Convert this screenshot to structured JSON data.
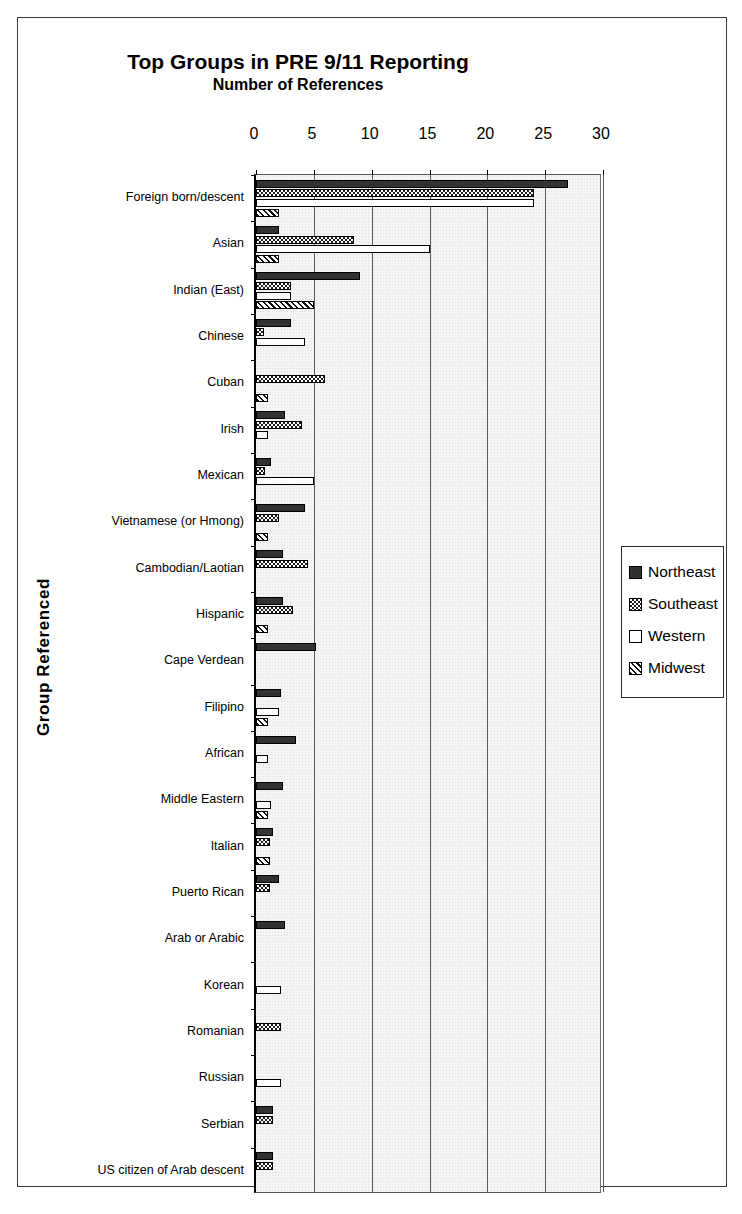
{
  "chart_data": {
    "type": "bar",
    "orientation": "horizontal",
    "title": "Top Groups in PRE 9/11 Reporting",
    "subtitle": "Number of References",
    "xlabel": "Number of References",
    "ylabel": "Group Referenced",
    "xlim": [
      0,
      30
    ],
    "xticks": [
      0,
      5,
      10,
      15,
      20,
      25,
      30
    ],
    "grid": "vertical",
    "legend_position": "right",
    "categories": [
      "Foreign born/descent",
      "Asian",
      "Indian (East)",
      "Chinese",
      "Cuban",
      "Irish",
      "Mexican",
      "Vietnamese (or Hmong)",
      "Cambodian/Laotian",
      "Hispanic",
      "Cape Verdean",
      "Filipino",
      "African",
      "Middle Eastern",
      "Italian",
      "Puerto Rican",
      "Arab or Arabic",
      "Korean",
      "Romanian",
      "Russian",
      "Serbian",
      "US citizen of Arab descent"
    ],
    "series": [
      {
        "name": "Northeast",
        "pattern": "gray-dotted",
        "values": [
          27,
          2,
          9,
          3,
          0,
          2.5,
          1.3,
          4.2,
          2.3,
          2.3,
          5.2,
          2.2,
          3.5,
          2.3,
          1.5,
          2,
          2.5,
          0,
          0,
          0,
          1.5,
          1.5
        ]
      },
      {
        "name": "Southeast",
        "pattern": "checkerboard",
        "values": [
          24,
          8.5,
          3,
          0.7,
          6,
          4,
          0.8,
          2,
          4.5,
          3.2,
          0,
          0,
          0,
          0,
          1.2,
          1.2,
          0,
          0,
          2.2,
          0,
          1.5,
          1.5
        ]
      },
      {
        "name": "Western",
        "pattern": "white",
        "values": [
          24,
          15,
          3,
          4.2,
          0,
          1,
          5,
          0,
          0,
          0,
          0,
          2,
          1,
          1.3,
          0,
          0,
          0,
          2.2,
          0,
          2.2,
          0,
          0
        ]
      },
      {
        "name": "Midwest",
        "pattern": "diagonal-hatch",
        "values": [
          2,
          2,
          5,
          0,
          1,
          0,
          0,
          1,
          0,
          1,
          0,
          1,
          0,
          1,
          1.2,
          0,
          0,
          0,
          0,
          0,
          0,
          0
        ]
      }
    ]
  },
  "legend": {
    "items": [
      {
        "label": "Northeast"
      },
      {
        "label": "Southeast"
      },
      {
        "label": "Western"
      },
      {
        "label": "Midwest"
      }
    ]
  },
  "colors": {
    "northeast": "#8a8a8a",
    "southeast": "#ffffff",
    "western": "#ffffff",
    "midwest": "#ffffff",
    "plot_background": "#f4f4f4",
    "axis": "#000000"
  }
}
